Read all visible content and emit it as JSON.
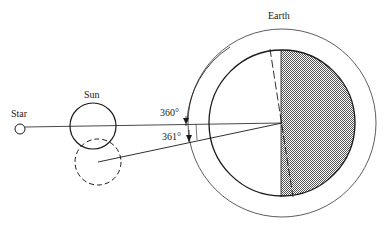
{
  "diagram": {
    "labels": {
      "star": "Star",
      "sun": "Sun",
      "earth": "Earth",
      "angle_360": "360°",
      "angle_361": "361°"
    },
    "colors": {
      "stroke": "#1a1a1a",
      "thin_stroke": "#333333",
      "night_fill": "#9a9a9a",
      "background": "#ffffff"
    }
  }
}
